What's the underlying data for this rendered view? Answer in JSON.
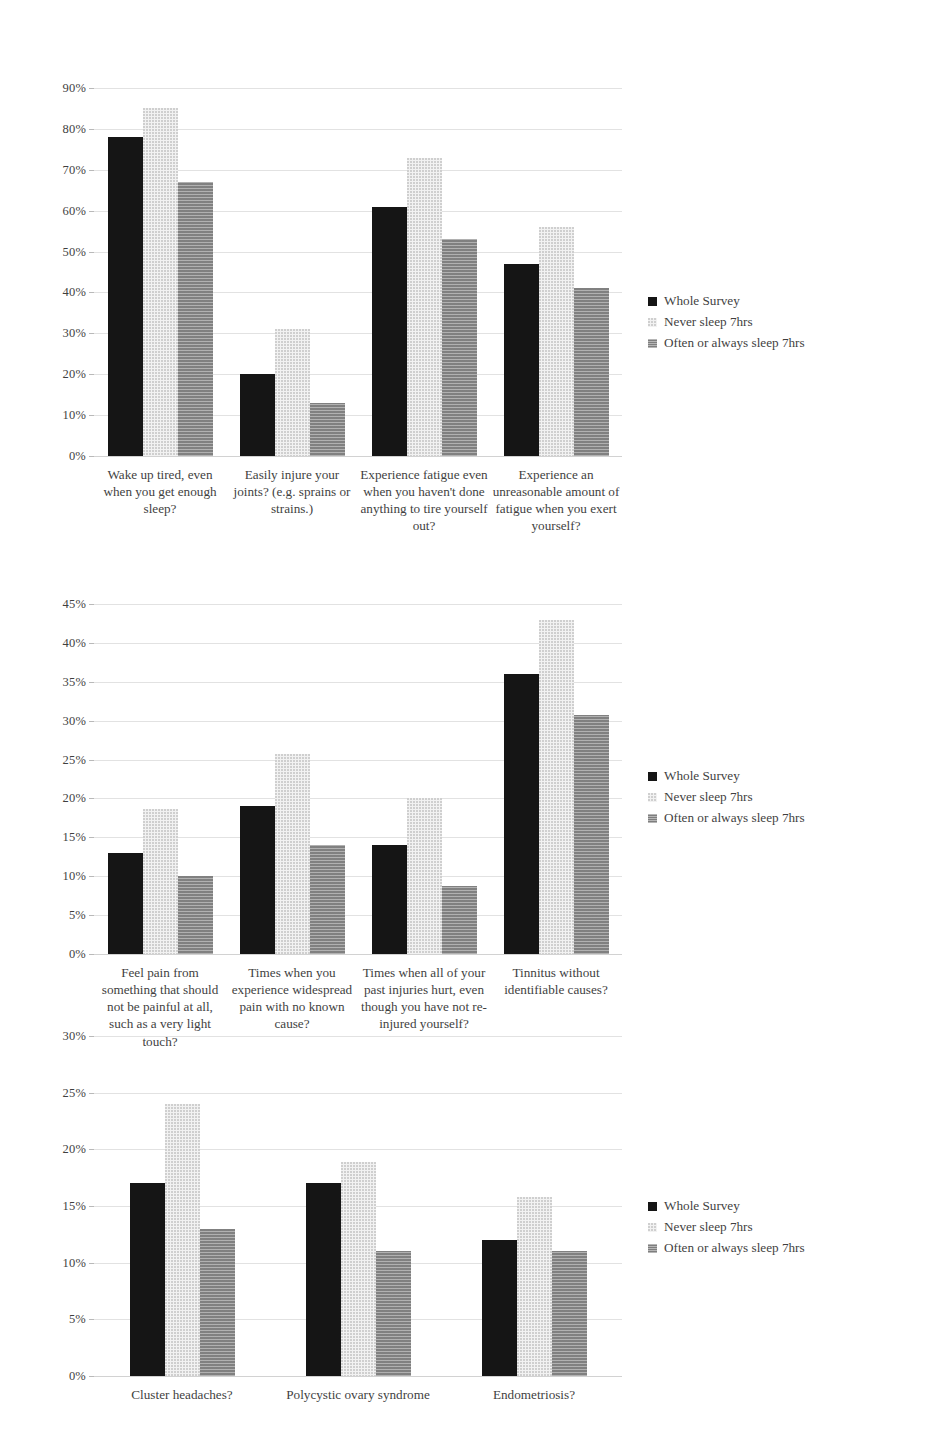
{
  "legend": {
    "entries": [
      {
        "label": "Whole Survey",
        "swatch": "s0",
        "color": "#151515"
      },
      {
        "label": "Never sleep 7hrs",
        "swatch": "s1",
        "color": "#f2f2f2"
      },
      {
        "label": "Often or always sleep 7hrs",
        "swatch": "s2",
        "color": "#8f8f8f"
      }
    ]
  },
  "chart_data": [
    {
      "type": "bar",
      "title": "",
      "xlabel": "",
      "ylabel": "",
      "ylim": [
        0,
        90
      ],
      "ytick_step": 10,
      "ticks": [
        "0%",
        "10%",
        "20%",
        "30%",
        "40%",
        "50%",
        "60%",
        "70%",
        "80%",
        "90%"
      ],
      "grid": true,
      "legend_position": "right",
      "categories": [
        "Wake up tired, even when you get enough sleep?",
        "Easily injure your joints? (e.g. sprains or strains.)",
        "Experience fatigue even when you haven't done anything to tire yourself out?",
        "Experience an unreasonable amount of fatigue when you exert yourself?"
      ],
      "series": [
        {
          "name": "Whole Survey",
          "values": [
            78,
            20,
            61,
            47
          ]
        },
        {
          "name": "Never sleep 7hrs",
          "values": [
            85,
            31,
            73,
            56
          ]
        },
        {
          "name": "Often or always sleep 7hrs",
          "values": [
            67,
            13,
            53,
            41
          ]
        }
      ]
    },
    {
      "type": "bar",
      "title": "",
      "xlabel": "",
      "ylabel": "",
      "ylim": [
        0,
        45
      ],
      "ytick_step": 5,
      "ticks": [
        "0%",
        "5%",
        "10%",
        "15%",
        "20%",
        "25%",
        "30%",
        "35%",
        "40%",
        "45%"
      ],
      "grid": true,
      "legend_position": "right",
      "categories": [
        "Feel pain from something that should not be painful at all, such as a very light touch?",
        "Times when you experience widespread pain with no known cause?",
        "Times when all of your past injuries hurt, even though you have not re-injured yourself?",
        "Tinnitus without identifiable causes?"
      ],
      "series": [
        {
          "name": "Whole Survey",
          "values": [
            13,
            19,
            14,
            36
          ]
        },
        {
          "name": "Never sleep 7hrs",
          "values": [
            18.7,
            25.7,
            20,
            43
          ]
        },
        {
          "name": "Often or always sleep 7hrs",
          "values": [
            10,
            14,
            8.7,
            30.7
          ]
        }
      ]
    },
    {
      "type": "bar",
      "title": "",
      "xlabel": "",
      "ylabel": "",
      "ylim": [
        0,
        30
      ],
      "ytick_step": 5,
      "ticks": [
        "0%",
        "5%",
        "10%",
        "15%",
        "20%",
        "25%",
        "30%"
      ],
      "grid": true,
      "legend_position": "right",
      "categories": [
        "Cluster headaches?",
        "Polycystic ovary syndrome",
        "Endometriosis?"
      ],
      "series": [
        {
          "name": "Whole Survey",
          "values": [
            17,
            17,
            12
          ]
        },
        {
          "name": "Never sleep 7hrs",
          "values": [
            24,
            18.9,
            15.8
          ]
        },
        {
          "name": "Often or always sleep 7hrs",
          "values": [
            13,
            11,
            11
          ]
        }
      ]
    }
  ]
}
